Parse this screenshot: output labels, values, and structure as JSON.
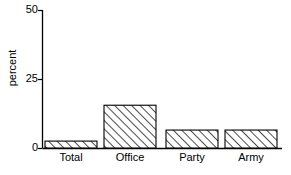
{
  "chart_data": {
    "type": "bar",
    "title": "",
    "subtitle": "",
    "xlabel": "",
    "ylabel": "percent",
    "categories": [
      "Total",
      "Office",
      "Party",
      "Army"
    ],
    "values": [
      2.5,
      15.5,
      6.5,
      6.5
    ],
    "series": [
      {
        "name": "percent",
        "values": [
          2.5,
          15.5,
          6.5,
          6.5
        ]
      }
    ],
    "ylim": [
      0,
      50
    ],
    "yticks": [
      0,
      25,
      50
    ],
    "ytick_labels": [
      "0",
      "25",
      "50"
    ],
    "xtick_labels": [
      "Total",
      "Office",
      "Party",
      "Army"
    ],
    "grid": false,
    "legend": false,
    "legend_position": "none",
    "bar_fill": "hatched-diagonal",
    "bar_edge_color": "#000000",
    "bar_fill_color": "#ffffff",
    "axis_color": "#000000",
    "background_color": "#ffffff",
    "annotations": []
  },
  "axes": {
    "y_title": "percent",
    "ticks_y": [
      {
        "label": "50",
        "value": 50
      },
      {
        "label": "25",
        "value": 25
      },
      {
        "label": "0",
        "value": 0
      }
    ],
    "ticks_x": [
      {
        "label": "Total"
      },
      {
        "label": "Office"
      },
      {
        "label": "Party"
      },
      {
        "label": "Army"
      }
    ]
  }
}
